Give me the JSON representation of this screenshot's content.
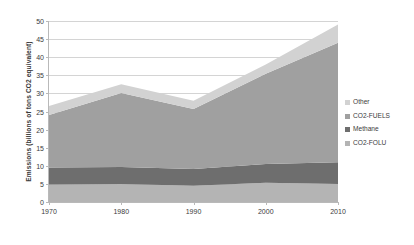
{
  "chart_data": {
    "type": "area",
    "title": "",
    "subtitle": "",
    "xlabel": "",
    "ylabel": "Emissions (billions of tons CO2 equivalent)",
    "x": [
      1970,
      1980,
      1990,
      2000,
      2010
    ],
    "xtick_labels": [
      "1970",
      "1980",
      "1990",
      "2000",
      "2010"
    ],
    "ytick_labels": [
      "0",
      "5",
      "10",
      "15",
      "20",
      "25",
      "30",
      "35",
      "40",
      "45",
      "50"
    ],
    "ytick_values": [
      0,
      5,
      10,
      15,
      20,
      25,
      30,
      35,
      40,
      45,
      50
    ],
    "ylim": [
      0,
      50
    ],
    "xlim": [
      1970,
      2010
    ],
    "grid": "horizontal",
    "legend_position": "right",
    "stacked": true,
    "stack_order_bottom_to_top": [
      "CO2-FOLU",
      "Methane",
      "CO2-FUELS",
      "Other"
    ],
    "series": [
      {
        "name": "Other",
        "color": "#d2d2d2",
        "values": [
          2.5,
          2.4,
          2.3,
          2.6,
          5.0
        ]
      },
      {
        "name": "CO2-FUELS",
        "color": "#a0a0a0",
        "values": [
          14.5,
          20.4,
          16.6,
          24.9,
          33.0
        ]
      },
      {
        "name": "Methane",
        "color": "#6e6e6e",
        "values": [
          4.7,
          4.7,
          4.6,
          5.2,
          6.0
        ]
      },
      {
        "name": "CO2-FOLU",
        "color": "#b4b4b4",
        "values": [
          4.8,
          5.0,
          4.5,
          5.3,
          5.0
        ]
      }
    ],
    "totals": [
      26.5,
      32.5,
      28.0,
      38.0,
      49.0
    ]
  },
  "legend": {
    "items": [
      {
        "label": "Other",
        "color": "#d2d2d2"
      },
      {
        "label": "CO2-FUELS",
        "color": "#a0a0a0"
      },
      {
        "label": "Methane",
        "color": "#6e6e6e"
      },
      {
        "label": "CO2-FOLU",
        "color": "#b4b4b4"
      }
    ]
  },
  "axes": {
    "y_title": "Emissions (billions of tons CO2 equivalent)"
  }
}
